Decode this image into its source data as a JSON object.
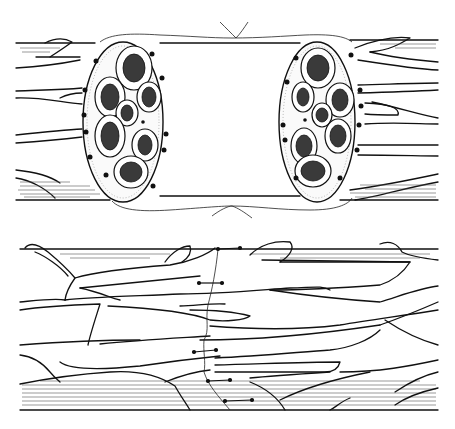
{
  "figure": {
    "panels": [
      {
        "id": "top",
        "description": "transected nerve stumps showing fascicular cross-sections with stay sutures"
      },
      {
        "id": "bottom",
        "description": "nerve after epineural repair with interrupted sutures along the coaptation line"
      }
    ],
    "colors": {
      "ink": "#111111",
      "background": "#ffffff",
      "shade": "#555555"
    }
  }
}
